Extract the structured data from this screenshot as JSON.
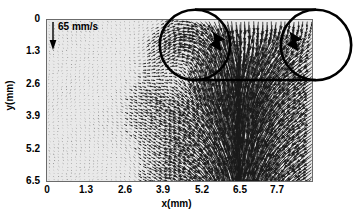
{
  "figure": {
    "kind": "piv-vector-field",
    "background_color": "#e9e9e9",
    "axis_color": "#6b6b6b",
    "vector_color": "#1a1a1a",
    "annotation_color": "#000000"
  },
  "axes": {
    "xlabel": "x(mm)",
    "ylabel": "y(mm)",
    "xticks": [
      "0",
      "1.3",
      "2.6",
      "3.9",
      "5.2",
      "6.5",
      "7.7"
    ],
    "yticks": [
      "0",
      "1.3",
      "2.6",
      "3.9",
      "5.2",
      "6.5"
    ]
  },
  "scale_reference": {
    "label": "65 mm/s",
    "direction": "down"
  },
  "annotations": {
    "left_circle_label": "vortex-region-left",
    "right_circle_label": "vortex-region-right",
    "arrow_label": "downward-flow-indicator"
  },
  "chart_data": {
    "type": "scatter",
    "plot_kind": "quiver/vector-field",
    "title": "",
    "xlabel": "x(mm)",
    "ylabel": "y(mm)",
    "xlim": [
      0,
      8.93
    ],
    "ylim": [
      6.5,
      0
    ],
    "y_axis_inverted": true,
    "xticks": [
      0,
      1.3,
      2.6,
      3.9,
      5.2,
      6.5,
      7.7
    ],
    "yticks": [
      0,
      1.3,
      2.6,
      3.9,
      5.2,
      6.5
    ],
    "grid": false,
    "legend": null,
    "scale_vector": {
      "label": "65 mm/s",
      "value": 65,
      "units": "mm/s",
      "angle_deg": 270
    },
    "annotations": [
      {
        "type": "circle",
        "cx": 5.0,
        "cy": 1.45,
        "r": 1.42,
        "linewidth": 2.4
      },
      {
        "type": "circle",
        "cx": 7.96,
        "cy": 1.4,
        "r": 1.36,
        "linewidth": 2.4
      },
      {
        "type": "line",
        "x1": 5.0,
        "y1": 0.03,
        "x2": 7.96,
        "y2": 0.03,
        "linewidth": 2.4
      },
      {
        "type": "line",
        "x1": 5.0,
        "y1": 2.87,
        "x2": 7.96,
        "y2": 2.87,
        "linewidth": 2.4
      },
      {
        "type": "arrowhead",
        "x": 5.95,
        "y": 1.45,
        "angle_deg": 250
      },
      {
        "type": "arrowhead",
        "x": 8.55,
        "y": 1.4,
        "angle_deg": 250
      }
    ],
    "field_description": "Downward (negative-y) jet strongest over x = 5.3-7.5 mm spanning full depth; weak near-stagnant small vectors for x < 3.5 mm; diagonal entrainment converging toward the jet from the lower-left; recirculation/vortex near x = 4.3-5.5 mm, y = 0-2 mm.",
    "grid_spacing_mm": {
      "x": 0.15,
      "y": 0.13
    },
    "series": [
      {
        "name": "velocity-vectors",
        "units": "mm/s",
        "reference_magnitude": 65
      }
    ]
  }
}
